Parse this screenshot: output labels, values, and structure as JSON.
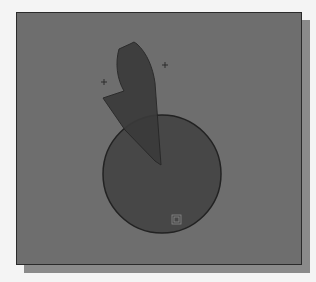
{
  "viewport": {
    "background": "#6e6e6e",
    "border": "#2a2a2a",
    "shadow": "#8a8a8a"
  },
  "drawing": {
    "circle": {
      "cx": 145,
      "cy": 161,
      "r": 59,
      "fill": "#474747",
      "stroke": "#222222"
    },
    "profile_shape": {
      "fill": "#3c3c3c",
      "stroke": "#252525"
    },
    "cross_markers": [
      {
        "x": 87,
        "y": 69
      },
      {
        "x": 148,
        "y": 52
      }
    ],
    "ucs_icon": {
      "x": 155,
      "y": 202,
      "size": 9
    }
  }
}
